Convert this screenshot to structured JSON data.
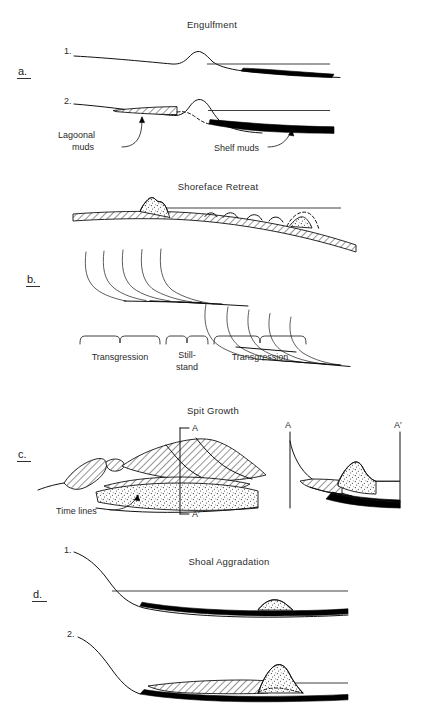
{
  "figure": {
    "kind": "geological-cross-section-diagram",
    "background_color": "#ffffff",
    "ink_color": "#111111"
  },
  "panels": [
    {
      "letter": "a.",
      "title": "Engulfment",
      "stages": [
        {
          "number": "1."
        },
        {
          "number": "2."
        }
      ],
      "annotations": [
        {
          "id": "lagoonal-muds",
          "line1": "Lagoonal",
          "line2": "muds",
          "text": "Lagoonal muds",
          "points_to": "hatched landward mud wedge"
        },
        {
          "id": "shelf-muds",
          "line1": "Shelf muds",
          "text": "Shelf muds",
          "points_to": "black seaward mud wedge"
        }
      ]
    },
    {
      "letter": "b.",
      "title": "Shoreface Retreat",
      "brackets": [
        {
          "id": "bracket-transgression-left",
          "line1": "Transgression",
          "line2": ""
        },
        {
          "id": "bracket-stillstand",
          "line1": "Still-",
          "line2": "stand"
        },
        {
          "id": "bracket-transgression-right",
          "line1": "Transgression",
          "line2": ""
        }
      ]
    },
    {
      "letter": "c.",
      "title": "Spit Growth",
      "section_markers": {
        "map_top": "A",
        "map_bottom": "A′",
        "section_left": "A",
        "section_right": "A′"
      },
      "annotations": [
        {
          "id": "time-lines",
          "line1": "Time lines",
          "text": "Time lines",
          "points_to": "stippled spit platform"
        }
      ]
    },
    {
      "letter": "d.",
      "title": "Shoal Aggradation",
      "stages": [
        {
          "number": "1."
        },
        {
          "number": "2."
        }
      ]
    }
  ],
  "legend_patterns": [
    {
      "id": "hatch",
      "name": "diagonal-hatch",
      "meaning": "lagoonal / back-barrier muds"
    },
    {
      "id": "stipple",
      "name": "stipple",
      "meaning": "sand body / barrier / shoal"
    },
    {
      "id": "solid-black",
      "name": "solid-black",
      "meaning": "shelf muds"
    }
  ]
}
